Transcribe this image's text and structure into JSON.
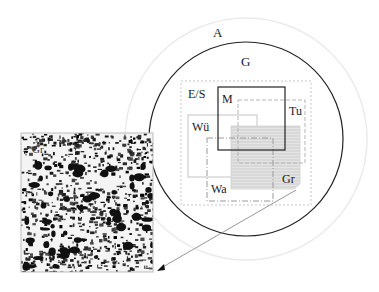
{
  "diagram": {
    "type": "nested-scale-diagram",
    "labels": {
      "outer_circle": "A",
      "inner_circle": "G",
      "dotted_region": "E/S",
      "solid_square": "M",
      "dashed_box": "Tu",
      "thin_box": "Wü",
      "dashdot_box": "Wa",
      "hatched_box": "Gr",
      "photo_label": "Gr"
    },
    "colors": {
      "outer_circle": "#e6e6e6",
      "inner_circle": "#222222",
      "dotted_region": "#c8c8c8",
      "solid_square": "#222222",
      "dashed_box": "#bdbdbd",
      "thin_box": "#c4c4c4",
      "dashdot_box": "#9a9a9a",
      "hatched_fill": "#e2e2e2",
      "hatch_lines": "#c9c9c9",
      "leader_line": "#8a8a8a",
      "photo_border": "#bbbbbb"
    },
    "photo": {
      "description": "Black-and-white grassland vegetation photograph",
      "linked_to": "Gr"
    }
  }
}
